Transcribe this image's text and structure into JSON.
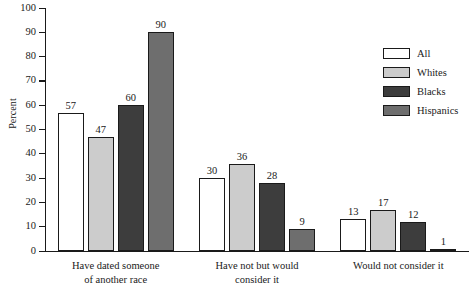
{
  "chart_data": {
    "type": "bar",
    "title": "",
    "xlabel": "",
    "ylabel": "Percent",
    "ylim": [
      0,
      100
    ],
    "ytick_labels": [
      "0",
      "10",
      "20",
      "30",
      "40",
      "50",
      "60",
      "70",
      "80",
      "90",
      "100"
    ],
    "ytick_values": [
      0,
      10,
      20,
      30,
      40,
      50,
      60,
      70,
      80,
      90,
      100
    ],
    "grid": false,
    "legend_position": "top-right",
    "categories": [
      "Have dated someone of another race",
      "Have not but would consider it",
      "Would not consider it"
    ],
    "category_lines": [
      [
        "Have dated someone",
        "of another race"
      ],
      [
        "Have not but would",
        "consider it"
      ],
      [
        "Would not consider it"
      ]
    ],
    "series": [
      {
        "name": "All",
        "color": "#ffffff",
        "values": [
          57,
          30,
          13
        ]
      },
      {
        "name": "Whites",
        "color": "#cccccc",
        "values": [
          47,
          36,
          17
        ]
      },
      {
        "name": "Blacks",
        "color": "#3d3d3d",
        "values": [
          60,
          28,
          12
        ]
      },
      {
        "name": "Hispanics",
        "color": "#6e6e6e",
        "values": [
          90,
          9,
          1
        ]
      }
    ]
  },
  "axis": {
    "y_title": "Percent"
  },
  "legend": {
    "items": [
      {
        "label": "All",
        "color": "#ffffff"
      },
      {
        "label": "Whites",
        "color": "#cccccc"
      },
      {
        "label": "Blacks",
        "color": "#3d3d3d"
      },
      {
        "label": "Hispanics",
        "color": "#6e6e6e"
      }
    ]
  },
  "colors": {
    "axis": "#1a1a1a",
    "text": "#1a1a1a",
    "background": "#ffffff"
  }
}
